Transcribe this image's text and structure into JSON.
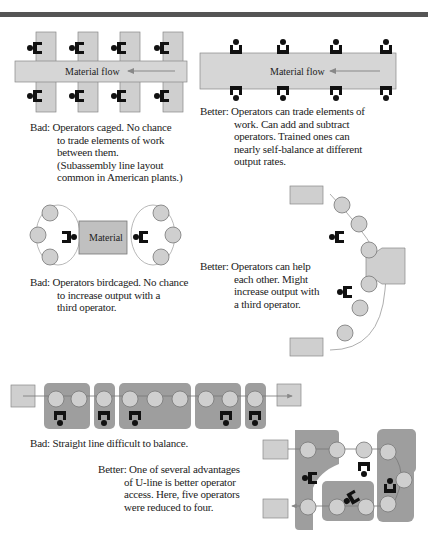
{
  "figure": {
    "panels": [
      {
        "id": "caged",
        "verdict": "Bad:",
        "flow_label": "Material flow",
        "lines": [
          "Operators caged. No chance",
          "to trade elements of work",
          "between them.",
          "(Subassembly line layout",
          "common in American plants.)"
        ]
      },
      {
        "id": "trade",
        "verdict": "Better:",
        "flow_label": "Material flow",
        "lines": [
          "Operators can trade elements of",
          "work. Can add and subtract",
          "operators. Trained ones can",
          "nearly self-balance at different",
          "output rates."
        ]
      },
      {
        "id": "birdcaged",
        "verdict": "Bad:",
        "box_label": "Material",
        "lines": [
          "Operators birdcaged. No chance",
          "to increase output with a",
          "third operator."
        ]
      },
      {
        "id": "arc",
        "verdict": "Better:",
        "lines": [
          "Operators can help",
          "each other. Might",
          "increase output with",
          "a third operator."
        ]
      },
      {
        "id": "straight",
        "verdict": "Bad:",
        "lines": [
          "Straight line difficult to balance."
        ]
      },
      {
        "id": "uline",
        "verdict": "Better:",
        "lines": [
          "One of several advantages",
          "of U-line is better operator",
          "access. Here, five operators",
          "were reduced to four."
        ]
      }
    ],
    "colors": {
      "gray_fill": "#c8c8c8",
      "dark_fill": "#9a9a9a",
      "operator": "#111111",
      "line": "#777777",
      "bar": "#555555"
    }
  }
}
